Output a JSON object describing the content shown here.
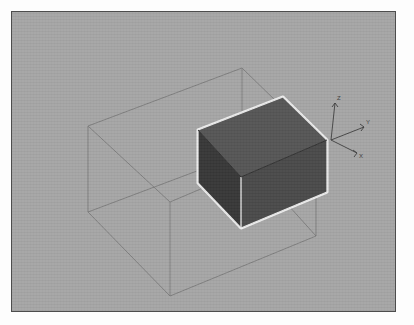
{
  "viewport": {
    "name": "3d-render-viewport",
    "background_color": "#a6a6a6",
    "border_color": "#4d4d4d",
    "page_background": "#fdfdfd",
    "panel": {
      "x": 11,
      "y": 11,
      "width": 385,
      "height": 301
    }
  },
  "axis_triad": {
    "origin": {
      "x": 331,
      "y": 140
    },
    "labels": {
      "x": "X",
      "y": "Y",
      "z": "Z"
    },
    "line_color": "#3d3d3d",
    "axes": [
      {
        "name": "z-axis",
        "label": "Z",
        "tip": {
          "x": 335,
          "y": 103
        },
        "label_pos": {
          "x": 337,
          "y": 100
        }
      },
      {
        "name": "y-axis",
        "label": "Y",
        "tip": {
          "x": 364,
          "y": 127
        },
        "label_pos": {
          "x": 366,
          "y": 125
        }
      },
      {
        "name": "x-axis",
        "label": "X",
        "tip": {
          "x": 357,
          "y": 153
        },
        "label_pos": {
          "x": 359,
          "y": 156
        }
      }
    ]
  },
  "wireframe_box": {
    "name": "bounding-box-wireframe",
    "stroke_color": "#7a7a7a",
    "stroke_width": 0.8,
    "vertices": {
      "top_back_left": {
        "x": 88,
        "y": 126
      },
      "top_back_right": {
        "x": 242,
        "y": 68
      },
      "top_front_right": {
        "x": 316,
        "y": 140
      },
      "top_front_left": {
        "x": 170,
        "y": 202
      },
      "bottom_back_left": {
        "x": 88,
        "y": 212
      },
      "bottom_back_right": {
        "x": 242,
        "y": 154
      },
      "bottom_front_right": {
        "x": 316,
        "y": 236
      },
      "bottom_front_left": {
        "x": 170,
        "y": 296
      }
    }
  },
  "solid_box": {
    "name": "solid-cuboid",
    "edge_highlight_color": "#efefef",
    "faces": [
      {
        "name": "top-face",
        "fill": "#565656",
        "points": "198,130 283,97 327,140 241,177"
      },
      {
        "name": "left-face",
        "fill": "#383838",
        "points": "198,130 241,177 241,228 198,183"
      },
      {
        "name": "right-face",
        "fill": "#4a4a4a",
        "points": "241,177 327,140 327,192 241,228"
      }
    ],
    "vertices": {
      "top_left": {
        "x": 198,
        "y": 130
      },
      "top_back": {
        "x": 283,
        "y": 97
      },
      "top_right": {
        "x": 327,
        "y": 140
      },
      "top_front": {
        "x": 241,
        "y": 177
      },
      "bottom_left": {
        "x": 198,
        "y": 183
      },
      "bottom_front": {
        "x": 241,
        "y": 228
      },
      "bottom_right": {
        "x": 327,
        "y": 192
      }
    }
  },
  "colors": {
    "background": "#a6a6a6",
    "panel_border": "#4d4d4d",
    "wire": "#7a7a7a",
    "face_top": "#565656",
    "face_left": "#383838",
    "face_right": "#4a4a4a",
    "edge_highlight": "#efefef"
  }
}
